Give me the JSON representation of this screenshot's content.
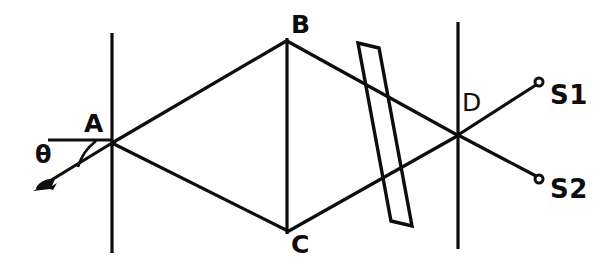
{
  "figure": {
    "kind": "optical-interferometer-diagram",
    "background_color": "#ffffff",
    "ink_color": "#0d0d0d",
    "width": 612,
    "height": 275
  },
  "labels": {
    "point_a": "A",
    "point_b": "B",
    "point_c": "C",
    "point_d": "D",
    "output_s1": "S1",
    "output_s2": "S2",
    "angle_theta": "θ"
  },
  "elements": {
    "mirror_left_name": "vertical-mirror-left",
    "mirror_mid_name": "vertical-mirror-middle",
    "mirror_right_name": "vertical-mirror-right",
    "glass_plate_name": "tilted-glass-plate",
    "incident_ray_name": "incident-ray",
    "reference_line_name": "horizontal-reference-line",
    "angle_arc_name": "angle-arc"
  },
  "geometry": {
    "mirror_left": {
      "x": 112,
      "y1": 33,
      "y2": 253
    },
    "mirror_mid": {
      "x": 287,
      "y1": 38,
      "y2": 234
    },
    "mirror_right": {
      "x": 458,
      "y1": 22,
      "y2": 249
    },
    "node_a": {
      "x": 112,
      "y": 143
    },
    "node_b": {
      "x": 287,
      "y": 40
    },
    "node_c": {
      "x": 287,
      "y": 231
    },
    "node_d": {
      "x": 458,
      "y": 135
    },
    "incident_tail": {
      "x": 36,
      "y": 189
    },
    "reference_line": {
      "x1": 48,
      "x2": 113,
      "y": 140
    },
    "plate_corners": "358,43 379,48 412,226 391,221",
    "s1_dot": {
      "x": 539,
      "y": 82,
      "r": 4
    },
    "s2_dot": {
      "x": 539,
      "y": 179,
      "r": 4
    },
    "stroke_width": 3.2
  },
  "label_positions": {
    "a": {
      "left": 84,
      "top": 111
    },
    "b": {
      "left": 291,
      "top": 12
    },
    "c": {
      "left": 291,
      "top": 232
    },
    "d": {
      "left": 462,
      "top": 90
    },
    "s1": {
      "left": 550,
      "top": 82
    },
    "s2": {
      "left": 550,
      "top": 176
    },
    "theta": {
      "left": 35,
      "top": 143
    }
  }
}
